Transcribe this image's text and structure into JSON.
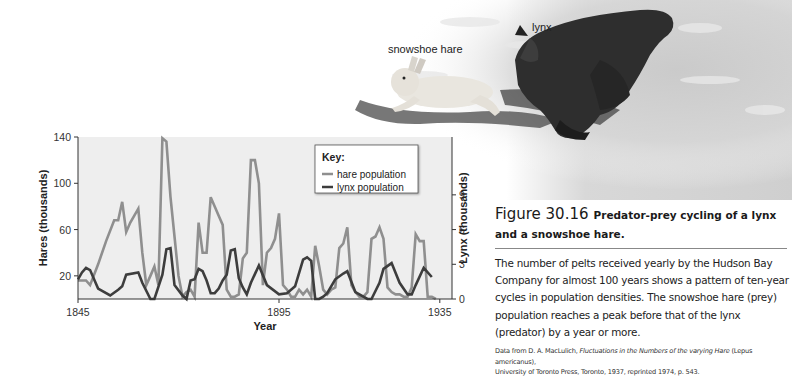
{
  "photo": {
    "labels": {
      "hare": "snowshoe hare",
      "lynx": "lynx"
    }
  },
  "caption": {
    "figure_number": "Figure 30.16",
    "title": "Predator-prey cycling of a lynx and a snowshoe hare.",
    "body": "The number of pelts received yearly by the Hudson Bay Company for almost 100 years shows a pattern of ten-year cycles in population densities. The snowshoe hare (prey) population reaches a peak before that of the lynx (predator) by a year or more.",
    "source_prefix": "Data from D. A. MacLulich, ",
    "source_italic": "Fluctuations in the Numbers of the varying Hare",
    "source_mid": " (Lepus americanus),",
    "source_suffix": "University of Toronto Press, Toronto, 1937, reprinted 1974, p. 543."
  },
  "colors": {
    "hare": "#8f8f8f",
    "lynx": "#3d3d3d",
    "plot_bg": "#eeeeee",
    "axis": "#333333"
  },
  "chart_data": {
    "type": "line",
    "title": "",
    "xlabel": "Year",
    "ylabel": "Hares (thousands)",
    "y2label": "Lynx (thousands)",
    "xlim": [
      1845,
      1938
    ],
    "ylim": [
      0,
      140
    ],
    "y2lim": [
      0,
      14
    ],
    "xticks": [
      1845,
      1895,
      1935
    ],
    "yticks": [
      20,
      60,
      100,
      140
    ],
    "y2ticks": [
      0,
      3,
      6,
      9
    ],
    "grid": false,
    "legend": {
      "title": "Key:",
      "position": "top-right",
      "entries": [
        "hare population",
        "lynx population"
      ]
    },
    "series": [
      {
        "name": "hare population",
        "axis": "left",
        "x": [
          1845,
          1847,
          1848,
          1850,
          1852,
          1854,
          1855,
          1856,
          1857,
          1858,
          1860,
          1861,
          1862,
          1863,
          1864,
          1865,
          1866,
          1867,
          1868,
          1869,
          1870,
          1871,
          1872,
          1873,
          1874,
          1875,
          1876,
          1877,
          1878,
          1879,
          1880,
          1881,
          1882,
          1883,
          1884,
          1885,
          1886,
          1887,
          1888,
          1889,
          1890,
          1891,
          1892,
          1893,
          1894,
          1895,
          1896,
          1897,
          1898,
          1899,
          1900,
          1901,
          1902,
          1903,
          1904,
          1905,
          1906,
          1907,
          1908,
          1909,
          1910,
          1911,
          1912,
          1913,
          1914,
          1915,
          1916,
          1917,
          1918,
          1919,
          1920,
          1921,
          1922,
          1923,
          1924,
          1925,
          1926,
          1927,
          1928,
          1929,
          1930,
          1931,
          1932,
          1933,
          1934
        ],
        "values": [
          16,
          16,
          12,
          30,
          50,
          68,
          68,
          84,
          58,
          66,
          78,
          40,
          12,
          20,
          28,
          12,
          139,
          136,
          88,
          54,
          20,
          2,
          6,
          8,
          2,
          66,
          40,
          40,
          88,
          80,
          72,
          64,
          8,
          2,
          2,
          4,
          35,
          40,
          120,
          120,
          100,
          12,
          40,
          44,
          52,
          74,
          12,
          8,
          2,
          2,
          8,
          4,
          8,
          2,
          46,
          28,
          8,
          4,
          8,
          10,
          44,
          48,
          62,
          12,
          6,
          2,
          2,
          6,
          52,
          54,
          62,
          52,
          10,
          6,
          4,
          4,
          2,
          2,
          10,
          56,
          50,
          50,
          2,
          2,
          0
        ],
        "units": "thousands"
      },
      {
        "name": "lynx population",
        "axis": "right",
        "x": [
          1845,
          1846,
          1847,
          1848,
          1850,
          1853,
          1855,
          1856,
          1857,
          1860,
          1861,
          1863,
          1864,
          1866,
          1867,
          1868,
          1869,
          1871,
          1872,
          1873,
          1874,
          1875,
          1876,
          1877,
          1878,
          1879,
          1880,
          1881,
          1882,
          1883,
          1884,
          1885,
          1886,
          1887,
          1888,
          1890,
          1892,
          1895,
          1897,
          1899,
          1901,
          1902,
          1903,
          1904,
          1905,
          1906,
          1907,
          1909,
          1911,
          1912,
          1914,
          1917,
          1918,
          1920,
          1921,
          1923,
          1925,
          1927,
          1928,
          1929,
          1931,
          1933
        ],
        "values": [
          1.7,
          2.3,
          2.7,
          2.5,
          0.9,
          0.3,
          0.8,
          1.1,
          2.1,
          2.3,
          1.4,
          0,
          0,
          2.1,
          4.3,
          4.4,
          1.2,
          0.3,
          0,
          1.6,
          1.7,
          2.6,
          2.4,
          1.6,
          0.5,
          0.5,
          0.9,
          1.6,
          2.1,
          4.2,
          4.3,
          1.8,
          1,
          0.4,
          1.4,
          2.9,
          1.2,
          0.4,
          0.5,
          1.1,
          3.4,
          3.6,
          3.3,
          0,
          0,
          0.2,
          0.5,
          1.7,
          2.2,
          2.4,
          0.6,
          0,
          0,
          1.4,
          2.6,
          3.1,
          1.4,
          0.4,
          0.4,
          1.2,
          2.7,
          1.9
        ],
        "units": "thousands"
      }
    ]
  }
}
